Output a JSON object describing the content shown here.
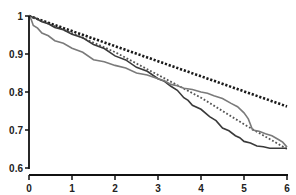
{
  "chart_data": {
    "type": "line",
    "title": "",
    "xlabel": "",
    "ylabel": "",
    "xlim": [
      0,
      6
    ],
    "ylim": [
      0.6,
      1.0
    ],
    "x_ticks": [
      "0",
      "1",
      "2",
      "3",
      "4",
      "5",
      "6"
    ],
    "y_ticks": [
      "0.6",
      "0.7",
      "0.8",
      "0.9",
      "1"
    ],
    "grid": false,
    "legend": null,
    "series": [
      {
        "name": "expected-black-dotted",
        "style": "dotted",
        "color": "#1a1a1a",
        "x": [
          0,
          6
        ],
        "y": [
          1.0,
          0.762
        ]
      },
      {
        "name": "expected-gray-dotted",
        "style": "dotted",
        "color": "#555555",
        "x": [
          0,
          1,
          2,
          3,
          4,
          5,
          6
        ],
        "y": [
          1.0,
          0.955,
          0.905,
          0.845,
          0.785,
          0.715,
          0.65
        ]
      },
      {
        "name": "observed-dark-step",
        "style": "step",
        "color": "#3a3a3a",
        "x": [
          0,
          0.3,
          0.6,
          1.0,
          1.5,
          2.0,
          2.5,
          3.0,
          3.3,
          3.6,
          3.8,
          4.2,
          4.5,
          4.8,
          5.0,
          5.3,
          5.6,
          6.0
        ],
        "y": [
          1.0,
          0.985,
          0.97,
          0.952,
          0.925,
          0.895,
          0.865,
          0.835,
          0.815,
          0.785,
          0.765,
          0.735,
          0.705,
          0.685,
          0.67,
          0.658,
          0.652,
          0.652
        ]
      },
      {
        "name": "observed-gray-step",
        "style": "step",
        "color": "#7a7a7a",
        "x": [
          0,
          0.1,
          0.3,
          0.6,
          1.0,
          1.5,
          2.0,
          2.5,
          3.0,
          3.3,
          3.6,
          4.0,
          4.3,
          4.7,
          5.0,
          5.2,
          5.5,
          5.8,
          6.0
        ],
        "y": [
          1.0,
          0.975,
          0.955,
          0.935,
          0.915,
          0.885,
          0.87,
          0.85,
          0.835,
          0.82,
          0.81,
          0.8,
          0.79,
          0.77,
          0.745,
          0.7,
          0.69,
          0.675,
          0.655
        ]
      }
    ]
  }
}
